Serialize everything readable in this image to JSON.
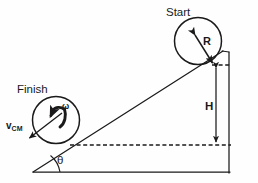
{
  "figure": {
    "kind": "physics-diagram",
    "background_color": "#fefefe",
    "stroke_color": "#1a1a1a"
  },
  "labels": {
    "start": "Start",
    "finish": "Finish",
    "radius": "R",
    "height": "H",
    "angle": "θ",
    "angular_velocity": "ω",
    "velocity_cm_base": "v",
    "velocity_cm_sub": "CM"
  },
  "icons": {
    "radius_arrow": "radius-arrow-icon",
    "height_arrow": "height-double-arrow-icon",
    "spin_arrow": "angular-velocity-arrow-icon",
    "velocity_arrow": "velocity-vector-arrow-icon"
  },
  "geometry": {
    "incline_apex": [
      222,
      52
    ],
    "incline_base_left": [
      33,
      172
    ],
    "base_right": [
      229,
      172
    ],
    "vertical_edge_top": [
      229,
      52
    ],
    "start_circle": {
      "cx": 198,
      "cy": 41,
      "r": 23
    },
    "finish_circle": {
      "cx": 56,
      "cy": 120,
      "r": 23
    },
    "contact_point_start": [
      213,
      65
    ],
    "dashed_top_line_y": 65,
    "dashed_bottom_line_y": 145,
    "height_arrow_x": 216
  }
}
